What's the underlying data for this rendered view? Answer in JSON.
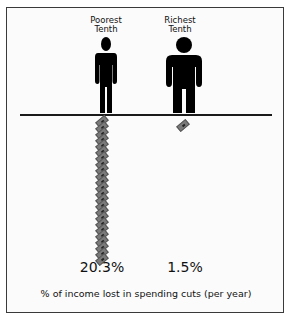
{
  "chart_data": {
    "type": "pictogram-bar",
    "title": "",
    "categories": [
      "Poorest Tenth",
      "Richest Tenth"
    ],
    "values": [
      20.3,
      1.5
    ],
    "value_labels": [
      "20.3%",
      "1.5%"
    ],
    "unit": "%",
    "xlabel": "% of income lost in spending cuts (per year)",
    "ylabel": "",
    "icons": {
      "group": "person-figure",
      "measure": "banknote"
    },
    "note_counts": [
      24,
      1
    ]
  },
  "labels": {
    "poor_line1": "Poorest",
    "poor_line2": "Tenth",
    "rich_line1": "Richest",
    "rich_line2": "Tenth",
    "poor_value": "20.3%",
    "rich_value": "1.5%",
    "caption": "% of income lost in spending cuts (per year)"
  },
  "colors": {
    "figure": "#000000",
    "note": "#7a7a7a",
    "border": "#3a3a3a"
  }
}
